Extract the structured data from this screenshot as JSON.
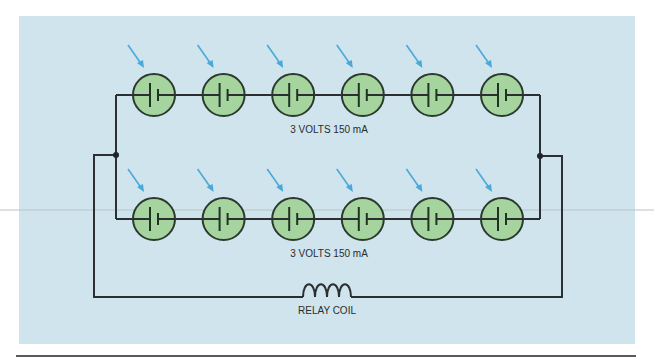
{
  "diagram": {
    "rows": [
      {
        "name": "top-row",
        "cell_count": 6,
        "label": "3 VOLTS 150 mA"
      },
      {
        "name": "bottom-row",
        "cell_count": 6,
        "label": "3 VOLTS 150 mA"
      }
    ],
    "components": {
      "cell_symbol": "battery-cell-icon",
      "light_indicator": "light-arrow-icon",
      "coil_label": "RELAY COIL",
      "coil_turns": 4
    },
    "colors": {
      "panel_background": "#cfe4ec",
      "cell_fill": "#a6d49f",
      "light_arrow": "#4aa9d8",
      "wire": "#2b2f31"
    }
  }
}
